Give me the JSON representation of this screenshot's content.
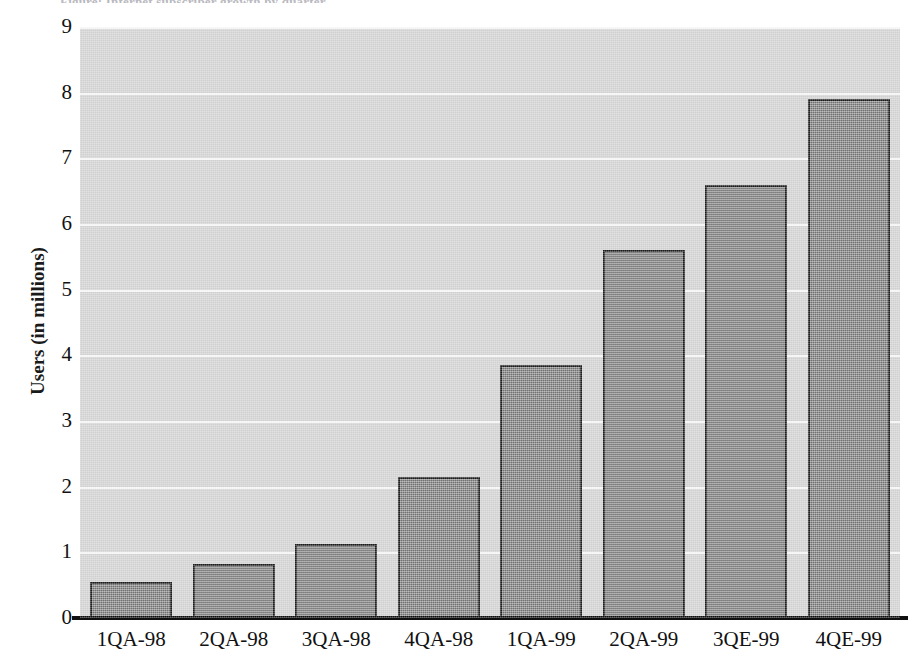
{
  "caption_remnant": "Figure: Internet subscriber growth by quarter",
  "chart_data": {
    "type": "bar",
    "title": "",
    "subtitle": "",
    "xlabel": "",
    "ylabel": "Users (in millions)",
    "categories": [
      "1QA-98",
      "2QA-98",
      "3QA-98",
      "4QA-98",
      "1QA-99",
      "2QA-99",
      "3QE-99",
      "4QE-99"
    ],
    "values": [
      0.55,
      0.82,
      1.13,
      2.15,
      3.85,
      5.6,
      6.6,
      7.9
    ],
    "series": [
      {
        "name": "Users",
        "values": [
          0.55,
          0.82,
          1.13,
          2.15,
          3.85,
          5.6,
          6.6,
          7.9
        ]
      }
    ],
    "ylim": [
      0,
      9
    ],
    "yticks": [
      0,
      1,
      2,
      3,
      4,
      5,
      6,
      7,
      8,
      9
    ],
    "ytick_labels": [
      "0",
      "1",
      "2",
      "3",
      "4",
      "5",
      "6",
      "7",
      "8",
      "9"
    ],
    "grid": true,
    "grid_axis": "y",
    "legend": false,
    "legend_position": "none",
    "colors": {
      "bar_fill": "#7d7d7d",
      "bar_border": "#1c1c1c",
      "plot_background": "#d0d0d0",
      "gridline": "#f4f4f4",
      "axis_line": "#101010",
      "text": "#111111",
      "figure_background": "#ffffff"
    }
  }
}
